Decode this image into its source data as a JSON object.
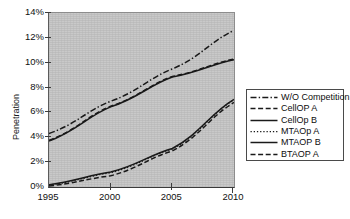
{
  "chart_data": {
    "type": "line",
    "title": "",
    "xlabel": "",
    "ylabel": "Penetration",
    "x": [
      1995,
      2000,
      2005,
      2010
    ],
    "xticklabels": [
      "1995",
      "2000",
      "2005",
      "2010"
    ],
    "yticklabels": [
      "0%",
      "2%",
      "4%",
      "6%",
      "8%",
      "10%",
      "12%",
      "14%"
    ],
    "ytickvalues": [
      0,
      2,
      4,
      6,
      8,
      10,
      12,
      14
    ],
    "xlim": [
      1995,
      2010
    ],
    "ylim": [
      0,
      14
    ],
    "grid": false,
    "legend_position": "right",
    "plot_background": "#c9c9c9",
    "page_background": "#ffffff",
    "line_color": "#1a1a1a",
    "series": [
      {
        "name": "W/O Competition",
        "style": "dashdot",
        "values": [
          4.3,
          6.9,
          9.5,
          12.6
        ]
      },
      {
        "name": "CellOP A",
        "style": "dashed",
        "values": [
          3.75,
          6.5,
          8.9,
          10.3
        ]
      },
      {
        "name": "CellOp B",
        "style": "solid",
        "values": [
          3.7,
          6.45,
          8.85,
          10.25
        ]
      },
      {
        "name": "MTAOp A",
        "style": "dotted",
        "values": [
          0.15,
          1.15,
          3.05,
          7.0
        ]
      },
      {
        "name": "MTAOP B",
        "style": "solid",
        "values": [
          0.18,
          1.2,
          3.1,
          7.05
        ]
      },
      {
        "name": "BTAOP A",
        "style": "dashed",
        "values": [
          0.08,
          0.9,
          2.9,
          6.8
        ]
      }
    ]
  },
  "legend": {
    "entries": [
      {
        "label": "W/O Competition"
      },
      {
        "label": "CellOP A"
      },
      {
        "label": "CellOp B"
      },
      {
        "label": "MTAOp A"
      },
      {
        "label": "MTAOP B"
      },
      {
        "label": "BTAOP A"
      }
    ]
  },
  "axes": {
    "ylabel": "Penetration"
  }
}
